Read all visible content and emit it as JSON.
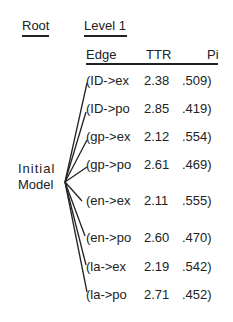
{
  "headers": {
    "root": "Root",
    "level1": "Level 1"
  },
  "columns": [
    "Edge",
    "TTR",
    "Pi"
  ],
  "root_node": {
    "line1": "Initial",
    "line2": "Model"
  },
  "rows": [
    {
      "edge": "(ID->ex",
      "ttr": "2.38",
      "pi": ".509)"
    },
    {
      "edge": "(ID->po",
      "ttr": "2.85",
      "pi": ".419)"
    },
    {
      "edge": "(gp->ex",
      "ttr": "2.12",
      "pi": ".554)"
    },
    {
      "edge": "(gp->po",
      "ttr": "2.61",
      "pi": ".469)"
    },
    {
      "edge": "(en->ex",
      "ttr": "2.11",
      "pi": ".555)"
    },
    {
      "edge": "(en->po",
      "ttr": "2.60",
      "pi": ".470)"
    },
    {
      "edge": "(la->ex",
      "ttr": "2.19",
      "pi": ".542)"
    },
    {
      "edge": "(la->po",
      "ttr": "2.71",
      "pi": ".452)"
    }
  ]
}
